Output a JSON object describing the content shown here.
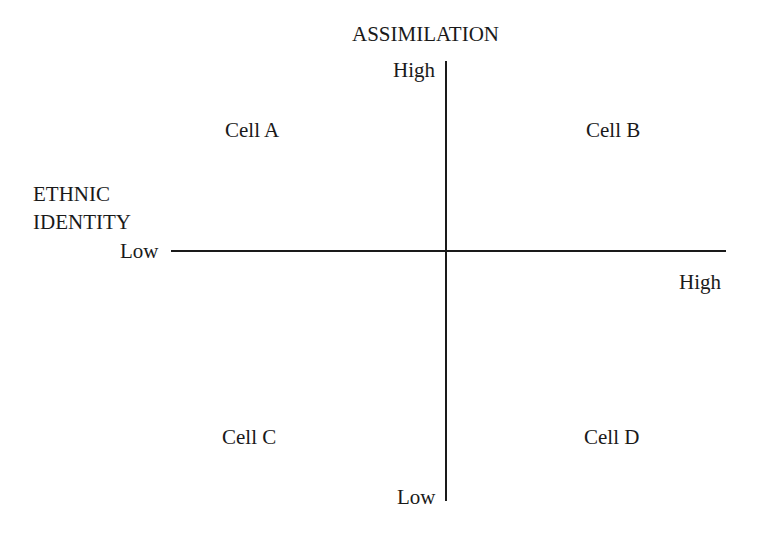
{
  "diagram": {
    "type": "quadrant",
    "vertical_axis": {
      "title": "ASSIMILATION",
      "high_label": "High",
      "low_label": "Low"
    },
    "horizontal_axis": {
      "title_line1": "ETHNIC",
      "title_line2": "IDENTITY",
      "low_label": "Low",
      "high_label": "High"
    },
    "cells": [
      {
        "label": "Cell A",
        "position": "top-left"
      },
      {
        "label": "Cell B",
        "position": "top-right"
      },
      {
        "label": "Cell C",
        "position": "bottom-left"
      },
      {
        "label": "Cell D",
        "position": "bottom-right"
      }
    ]
  }
}
